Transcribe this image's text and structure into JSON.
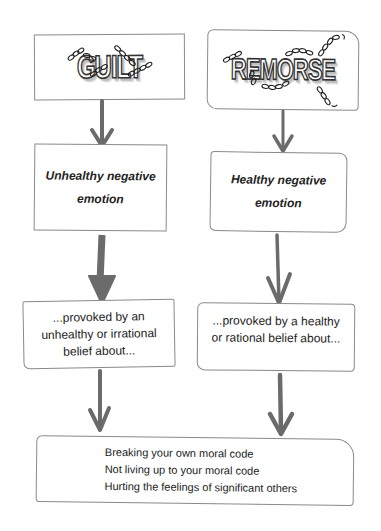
{
  "diagram": {
    "left_column": {
      "title": "GUILT",
      "emotion": {
        "line1": "Unhealthy negative",
        "line2": "emotion"
      },
      "belief": {
        "line1": "...provoked by an",
        "line2": "unhealthy or irrational",
        "line3": "belief about..."
      }
    },
    "right_column": {
      "title": "REMORSE",
      "emotion": {
        "line1": "Healthy negative",
        "line2": "emotion"
      },
      "belief": {
        "line1": "...provoked by a healthy",
        "line2": "or rational belief about..."
      }
    },
    "shared_outcomes": {
      "items": [
        "Breaking your own moral code",
        "Not living up to your moral code",
        "Hurting the feelings of significant others"
      ]
    },
    "colors": {
      "arrow": "#6b6b6b",
      "box_border": "#8a8a8a",
      "text": "#222222"
    }
  }
}
